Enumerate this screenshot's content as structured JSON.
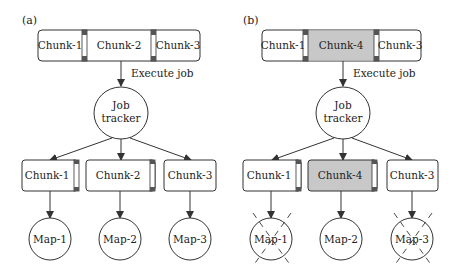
{
  "panels": [
    {
      "id": "a",
      "label": "(a)",
      "file_chunks": [
        "Chunk-1",
        "Chunk-2",
        "Chunk-3"
      ],
      "edge_label": "Execute job",
      "tracker_line1": "Job",
      "tracker_line2": "tracker",
      "task_chunks": [
        "Chunk-1",
        "Chunk-2",
        "Chunk-3"
      ],
      "maps": [
        "Map-1",
        "Map-2",
        "Map-3"
      ],
      "failed_maps": []
    },
    {
      "id": "b",
      "label": "(b)",
      "file_chunks": [
        "Chunk-1",
        "Chunk-4",
        "Chunk-3"
      ],
      "edge_label": "Execute job",
      "tracker_line1": "Job",
      "tracker_line2": "tracker",
      "task_chunks": [
        "Chunk-1",
        "Chunk-4",
        "Chunk-3"
      ],
      "maps": [
        "Map-1",
        "Map-2",
        "Map-3"
      ],
      "failed_maps": [
        "Map-1",
        "Map-3"
      ],
      "highlighted_chunk": "Chunk-4"
    }
  ],
  "colors": {
    "highlight": "#c8c8c8",
    "stroke": "#333333"
  }
}
